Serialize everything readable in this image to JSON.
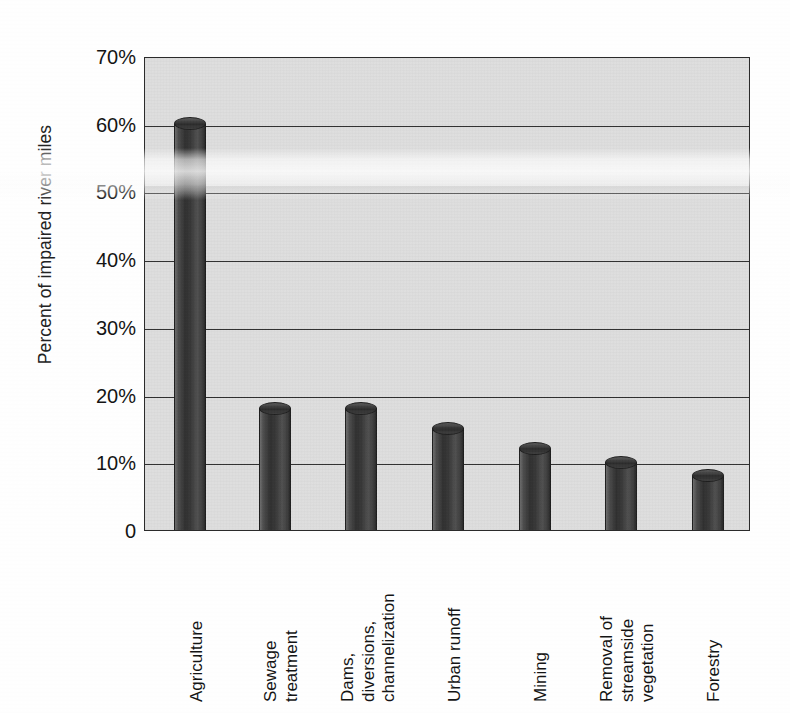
{
  "chart_data": {
    "type": "bar",
    "title": "",
    "xlabel": "",
    "ylabel": "Percent of impaired river miles",
    "ylim": [
      0,
      70
    ],
    "grid": true,
    "legend": "none",
    "units": "percent",
    "categories": [
      "Agriculture",
      "Sewage\ntreatment",
      "Dams,\ndiversions,\nchannelization",
      "Urban runoff",
      "Mining",
      "Removal of\nstreamside\nvegetation",
      "Forestry"
    ],
    "values": [
      60,
      18,
      18,
      15,
      12,
      10,
      8
    ],
    "ytick_labels": [
      "70%",
      "60%",
      "50%",
      "40%",
      "30%",
      "20%",
      "10%",
      "0"
    ],
    "ytick_values": [
      70,
      60,
      50,
      40,
      30,
      20,
      10,
      0
    ]
  },
  "style": {
    "plot_background": "#dedede",
    "axis_color": "#2b2b2b",
    "bar_color": "#3a3a3a",
    "page_background": "#ffffff"
  }
}
